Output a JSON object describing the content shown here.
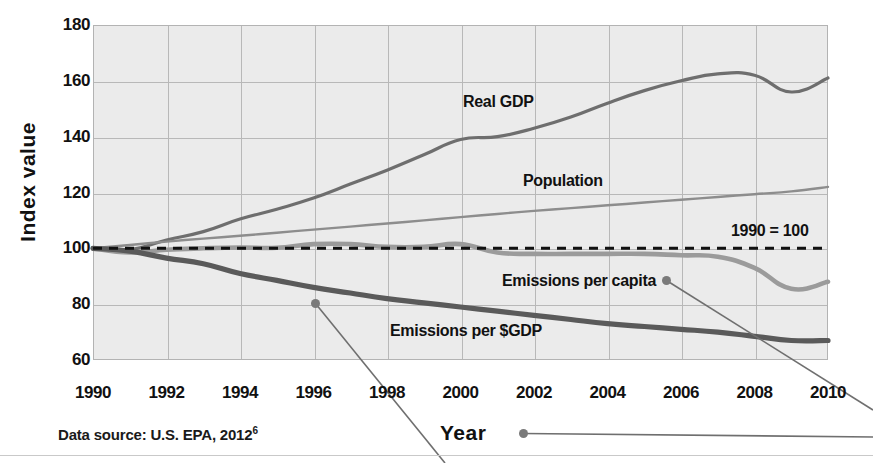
{
  "figure": {
    "y_axis_title": "Index value",
    "x_axis_title": "Year",
    "source_note_prefix": "Data source: U.S. EPA, 2012",
    "source_note_superscript": "6",
    "reference_label": "1990 = 100"
  },
  "labels": {
    "real_gdp": "Real GDP",
    "population": "Population",
    "emissions_per_capita": "Emissions per capita",
    "emissions_per_gdp": "Emissions per $GDP"
  },
  "colors": {
    "plot_background": "#ebebeb",
    "gridline": "#b8b8b8",
    "real_gdp": "#6e6e6e",
    "population": "#8d8d8d",
    "emissions_per_capita": "#9b9b9b",
    "emissions_per_gdp": "#5a5a5a",
    "reference_line": "#111111",
    "callout": "#7a7a7a",
    "text": "#111111"
  },
  "chart_data": {
    "type": "line",
    "title": "",
    "xlabel": "Year",
    "ylabel": "Index value",
    "xlim": [
      1990,
      2010
    ],
    "ylim": [
      60,
      180
    ],
    "ytick_labels": [
      180,
      160,
      140,
      120,
      100,
      80,
      60
    ],
    "xtick_labels": [
      1990,
      1992,
      1994,
      1996,
      1998,
      2000,
      2002,
      2004,
      2006,
      2008,
      2010
    ],
    "grid": true,
    "legend": "inline-labels",
    "annotations": [
      {
        "text": "1990 = 100",
        "type": "reference-line",
        "y": 100,
        "style": "dashed"
      },
      {
        "text": "Real GDP",
        "type": "series-label"
      },
      {
        "text": "Population",
        "type": "series-label"
      },
      {
        "text": "Emissions per capita",
        "type": "series-label",
        "callout": true
      },
      {
        "text": "Emissions per $GDP",
        "type": "series-label",
        "callout": true
      },
      {
        "text": "Year",
        "type": "axis-title-callout",
        "callout": true
      }
    ],
    "x": [
      1990,
      1991,
      1992,
      1993,
      1994,
      1995,
      1996,
      1997,
      1998,
      1999,
      2000,
      2001,
      2002,
      2003,
      2004,
      2005,
      2006,
      2007,
      2008,
      2009,
      2010
    ],
    "series": [
      {
        "name": "Real GDP",
        "color": "#6e6e6e",
        "values": [
          100,
          99.5,
          103,
          106,
          110.5,
          114,
          118,
          123,
          128,
          133.5,
          139,
          140,
          143,
          147,
          152,
          156.5,
          160,
          162.5,
          162,
          156,
          161
        ]
      },
      {
        "name": "Population",
        "color": "#8d8d8d",
        "values": [
          100,
          101.2,
          102.4,
          103.5,
          104.5,
          105.6,
          106.7,
          107.8,
          108.9,
          110,
          111.2,
          112.3,
          113.4,
          114.4,
          115.4,
          116.4,
          117.4,
          118.4,
          119.4,
          120.4,
          122
        ]
      },
      {
        "name": "Emissions per capita",
        "color": "#9b9b9b",
        "values": [
          100,
          98.5,
          99.5,
          100,
          100.3,
          100.2,
          101.5,
          101.5,
          100.5,
          100.5,
          101.5,
          98.5,
          98,
          98,
          98,
          98,
          97.5,
          97,
          93,
          85.5,
          88
        ]
      },
      {
        "name": "Emissions per $GDP",
        "color": "#5a5a5a",
        "values": [
          100,
          99,
          96.5,
          94.5,
          91,
          88.5,
          86,
          84,
          82,
          80.5,
          79,
          77.5,
          76,
          74.5,
          73,
          72,
          71,
          70,
          68.5,
          67,
          67
        ]
      }
    ]
  }
}
